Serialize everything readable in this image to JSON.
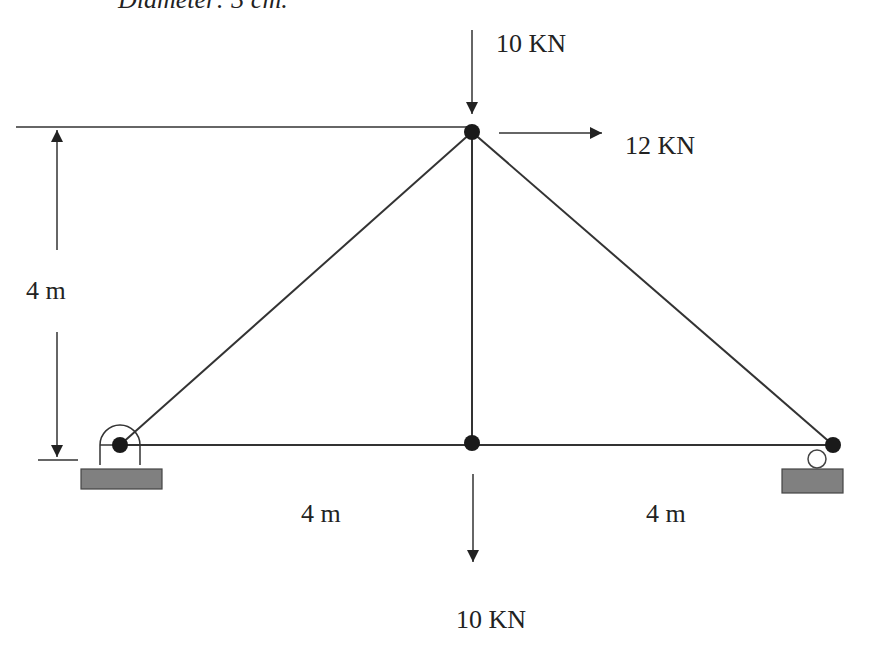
{
  "caption": "Diameter: 3 cm.",
  "dimensions": {
    "height": "4 m",
    "left_span": "4 m",
    "right_span": "4 m"
  },
  "loads": {
    "top_vertical": "10 KN",
    "top_horizontal": "12 KN",
    "bottom_vertical": "10 KN"
  },
  "supports": {
    "left": "pin",
    "right": "roller"
  },
  "colors": {
    "line": "#333333",
    "node": "#1a1a1a",
    "ground": "#808080"
  }
}
